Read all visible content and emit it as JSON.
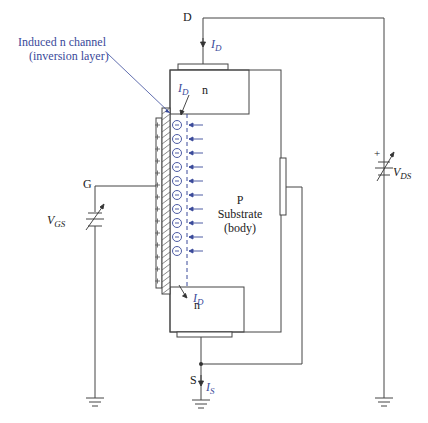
{
  "terminals": {
    "drain": "D",
    "gate": "G",
    "source": "S"
  },
  "annotation": {
    "line1": "Induced n channel",
    "line2": "(inversion layer)"
  },
  "regions": {
    "drain_region": "n",
    "source_region": "n",
    "substrate_line1": "P",
    "substrate_line2": "Substrate",
    "substrate_line3": "(body)"
  },
  "currents": {
    "drain_current_main": {
      "base": "I",
      "sub": "D"
    },
    "drain_current_channel_top": {
      "base": "I",
      "sub": "D"
    },
    "drain_current_channel_bottom": {
      "base": "I",
      "sub": "D"
    },
    "source_current": {
      "base": "I",
      "sub": "S"
    }
  },
  "sources": {
    "vgs": {
      "base": "V",
      "sub": "GS"
    },
    "vds": {
      "base": "V",
      "sub": "DS",
      "polarity": "+"
    }
  },
  "channel": {
    "electron_count": 11,
    "gate_plus_count": 14,
    "electron_symbol": "⊖"
  },
  "colors": {
    "line": "#444444",
    "accent_blue": "#3a4a9a"
  }
}
